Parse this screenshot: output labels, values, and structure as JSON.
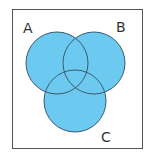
{
  "diagram": {
    "type": "venn",
    "sets": [
      {
        "label": "A",
        "cx": 57,
        "cy": 63,
        "r": 31,
        "label_x": 28,
        "label_y": 33
      },
      {
        "label": "B",
        "cx": 94,
        "cy": 63,
        "r": 31,
        "label_x": 121,
        "label_y": 32
      },
      {
        "label": "C",
        "cx": 75,
        "cy": 101,
        "r": 31,
        "label_x": 106,
        "label_y": 140
      }
    ],
    "fill_color": "#6ccaf0",
    "stroke_color": "#3c5a72",
    "frame_color": "#555555"
  }
}
